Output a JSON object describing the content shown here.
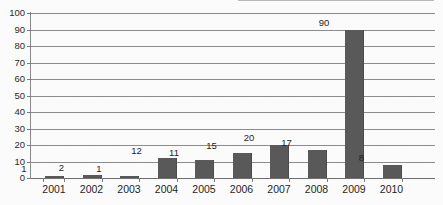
{
  "chart_data": {
    "type": "bar",
    "title": "",
    "subtitle": "",
    "xlabel": "",
    "ylabel": "",
    "categories": [
      "2001",
      "2002",
      "2003",
      "2004",
      "2005",
      "2006",
      "2007",
      "2008",
      "2009",
      "2010"
    ],
    "values": [
      1,
      2,
      1,
      12,
      11,
      15,
      20,
      17,
      90,
      8
    ],
    "data_labels": [
      "1",
      "2",
      "1",
      "12",
      "11",
      "15",
      "20",
      "17",
      "90",
      "8"
    ],
    "ylim": [
      0,
      100
    ],
    "ytick_step": 10,
    "ytick_labels": [
      "0",
      "10",
      "20",
      "30",
      "40",
      "50",
      "60",
      "70",
      "80",
      "90",
      "100"
    ],
    "grid": "horizontal",
    "legend": "none",
    "bar_color": "#5a5a5a",
    "gridline_color": "#8d8d8d",
    "axis_color": "#8a8a8a",
    "text_color": "#1f1f1f",
    "background_color": "#ffffff"
  }
}
